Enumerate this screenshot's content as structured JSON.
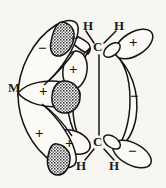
{
  "figure": {
    "kind": "chemical-orbital-interaction-diagram",
    "background_color": "#f7f6f2",
    "stroke_color": "#141414",
    "shaded_lobe_color": "#8f8f8f",
    "open_lobe_color": "#fbfaf7",
    "width": 166,
    "height": 188
  },
  "atoms": {
    "metal": {
      "label": "M",
      "x": 14,
      "y": 88
    },
    "carbon_top": {
      "label": "C",
      "x": 97,
      "y": 47
    },
    "carbon_bottom": {
      "label": "C",
      "x": 97,
      "y": 142
    },
    "hydrogens": [
      {
        "label": "H",
        "x": 88,
        "y": 26,
        "position": "top-left"
      },
      {
        "label": "H",
        "x": 119,
        "y": 26,
        "position": "top-right"
      },
      {
        "label": "H",
        "x": 80,
        "y": 166,
        "position": "bottom-left"
      },
      {
        "label": "H",
        "x": 113,
        "y": 166,
        "position": "bottom-right"
      }
    ]
  },
  "signs": [
    {
      "symbol": "−",
      "x": 43,
      "y": 49,
      "lobe": "metal-upper-outer",
      "shaded": false
    },
    {
      "symbol": "−",
      "x": 75,
      "y": 39,
      "lobe": "alkene-pi-top-left",
      "shaded": false
    },
    {
      "symbol": "+",
      "x": 75,
      "y": 71,
      "lobe": "alkene-pi-mid-upper",
      "shaded": false
    },
    {
      "symbol": "+",
      "x": 45,
      "y": 93,
      "lobe": "metal-central",
      "shaded": false
    },
    {
      "symbol": "+",
      "x": 41,
      "y": 135,
      "lobe": "metal-lower-outer",
      "shaded": false
    },
    {
      "symbol": "+",
      "x": 71,
      "y": 145,
      "lobe": "alkene-pi-bottom-left",
      "shaded": false
    },
    {
      "symbol": "+",
      "x": 135,
      "y": 43,
      "lobe": "alkene-pistar-top-right",
      "shaded": false
    },
    {
      "symbol": "−",
      "x": 135,
      "y": 97,
      "lobe": "alkene-pistar-mid-right",
      "shaded": false
    },
    {
      "symbol": "−",
      "x": 133,
      "y": 152,
      "lobe": "alkene-pistar-bottom-right",
      "shaded": false
    }
  ],
  "shaded_lobes": [
    {
      "name": "metal-upper-shaded",
      "cx": 63,
      "cy": 34
    },
    {
      "name": "metal-central-shaded",
      "cx": 70,
      "cy": 97
    },
    {
      "name": "metal-lower-shaded",
      "cx": 58,
      "cy": 158
    }
  ],
  "bonds": {
    "c_c_double_bond": {
      "from": "carbon_top",
      "to": "carbon_bottom"
    },
    "c_h_bonds": 4
  }
}
